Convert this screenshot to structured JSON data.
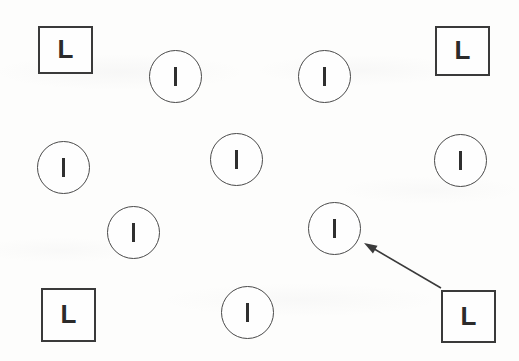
{
  "display": {
    "title": "visual-search-display",
    "width": 519,
    "height": 361,
    "background_color": "#fdfdfc",
    "stroke_color": "#3a3a3a",
    "glyph_color": "#2f2f2f"
  },
  "items": [
    {
      "id": "square-top-left",
      "shape": "square",
      "letter": "L",
      "x": 38,
      "y": 26,
      "w": 55,
      "h": 48
    },
    {
      "id": "circle-top-left",
      "shape": "circle",
      "letter": "I",
      "x": 149,
      "y": 50,
      "w": 53,
      "h": 53
    },
    {
      "id": "circle-top-right",
      "shape": "circle",
      "letter": "I",
      "x": 298,
      "y": 50,
      "w": 53,
      "h": 53
    },
    {
      "id": "square-top-right",
      "shape": "square",
      "letter": "L",
      "x": 435,
      "y": 26,
      "w": 55,
      "h": 50
    },
    {
      "id": "circle-mid-left",
      "shape": "circle",
      "letter": "I",
      "x": 37,
      "y": 141,
      "w": 53,
      "h": 53
    },
    {
      "id": "circle-mid-center",
      "shape": "circle",
      "letter": "I",
      "x": 210,
      "y": 133,
      "w": 53,
      "h": 53
    },
    {
      "id": "circle-mid-right",
      "shape": "circle",
      "letter": "I",
      "x": 434,
      "y": 134,
      "w": 53,
      "h": 53
    },
    {
      "id": "circle-lower-left",
      "shape": "circle",
      "letter": "I",
      "x": 107,
      "y": 206,
      "w": 53,
      "h": 53
    },
    {
      "id": "circle-target",
      "shape": "circle",
      "letter": "I",
      "x": 308,
      "y": 202,
      "w": 53,
      "h": 53
    },
    {
      "id": "square-bottom-left",
      "shape": "square",
      "letter": "L",
      "x": 41,
      "y": 288,
      "w": 55,
      "h": 54
    },
    {
      "id": "circle-bottom",
      "shape": "circle",
      "letter": "I",
      "x": 221,
      "y": 286,
      "w": 53,
      "h": 53
    },
    {
      "id": "square-bottom-right",
      "shape": "square",
      "letter": "L",
      "x": 441,
      "y": 290,
      "w": 55,
      "h": 53
    }
  ],
  "arrow": {
    "id": "pointer-arrow",
    "from_x": 441,
    "from_y": 288,
    "to_x": 364,
    "to_y": 243,
    "color": "#3a3a3a",
    "stroke_width": 1.6,
    "head_length": 13,
    "head_width": 9,
    "points_to": "circle-target"
  }
}
